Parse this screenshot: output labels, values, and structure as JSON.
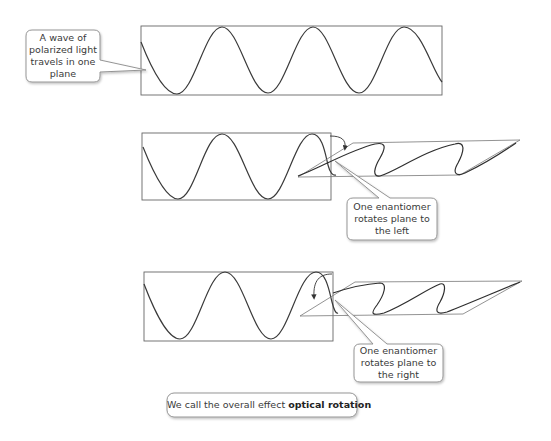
{
  "figure": {
    "panels": [
      {
        "id": "plane-polarized",
        "callout": {
          "lines": [
            "A wave of",
            "polarized light",
            "travels in one",
            "plane"
          ]
        }
      },
      {
        "id": "rotate-left",
        "callout": {
          "lines": [
            "One enantiomer",
            "rotates plane to",
            "the left"
          ]
        }
      },
      {
        "id": "rotate-right",
        "callout": {
          "lines": [
            "One enantiomer",
            "rotates plane to",
            "the right"
          ]
        }
      }
    ],
    "summary": {
      "prefix": "We call the overall effect ",
      "bold": "optical rotation"
    },
    "colors": {
      "line": "#555555",
      "wave": "#3a3a3a",
      "callout_border": "#8a8a8a",
      "callout_fill": "#ffffff"
    }
  }
}
